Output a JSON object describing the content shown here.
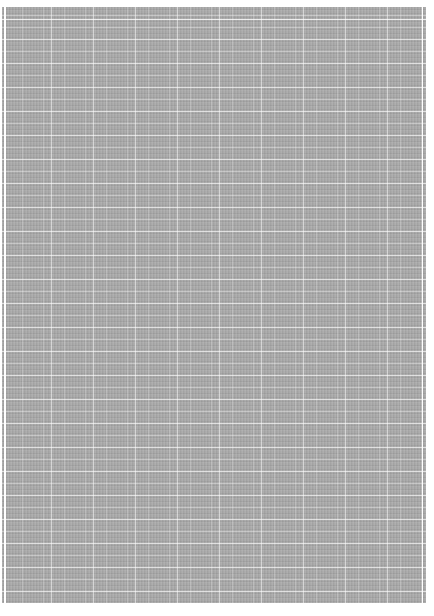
{
  "document": {
    "type": "grid-paper-scan",
    "background_color": "#ffffff",
    "paper_color": "#a9a9a9",
    "grid_line_color": "#ffffff",
    "grid": {
      "major_vertical_spacing_px": 42,
      "minor_vertical_spacing_px": 21,
      "horizontal_spacing_px": 12
    },
    "text": []
  }
}
